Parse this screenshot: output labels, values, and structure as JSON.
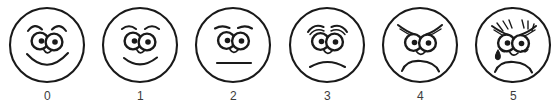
{
  "scale": {
    "title": "Faces pain rating scale",
    "type": "faces-pain-scale",
    "ink_color": "#1a1a1a",
    "label_color": "#3c3c3c",
    "background_color": "#ffffff",
    "faces": [
      {
        "label": "0",
        "expression": "big smile",
        "icon": "face-smiling-icon",
        "center_x": 47,
        "mouth": "wide-smile",
        "brows": "high-arched",
        "tear": false
      },
      {
        "label": "1",
        "expression": "slight smile",
        "icon": "face-slight-smile-icon",
        "center_x": 140,
        "mouth": "small-smile",
        "brows": "arched",
        "tear": false
      },
      {
        "label": "2",
        "expression": "neutral",
        "icon": "face-neutral-icon",
        "center_x": 233,
        "mouth": "straight-line",
        "brows": "flat-arched",
        "tear": false
      },
      {
        "label": "3",
        "expression": "slight frown",
        "icon": "face-slight-frown-icon",
        "center_x": 327,
        "mouth": "small-frown",
        "brows": "worried",
        "tear": false
      },
      {
        "label": "4",
        "expression": "frown",
        "icon": "face-frowning-icon",
        "center_x": 420,
        "mouth": "deep-frown",
        "brows": "sad-droop",
        "tear": false
      },
      {
        "label": "5",
        "expression": "crying",
        "icon": "face-crying-icon",
        "center_x": 513,
        "mouth": "deep-frown",
        "brows": "anguished-shaded",
        "tear": true
      }
    ]
  }
}
